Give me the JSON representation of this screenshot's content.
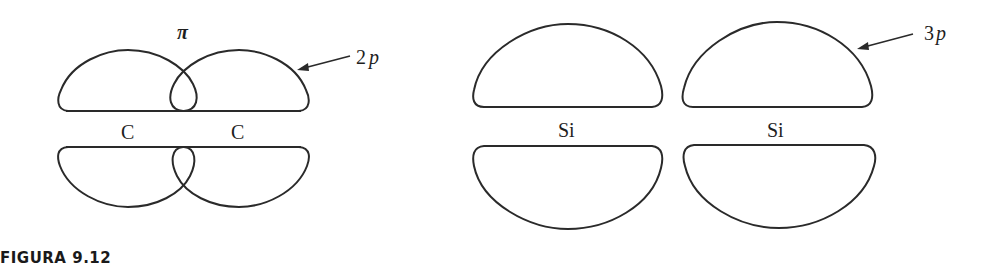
{
  "figure": {
    "caption": "FIGURA 9.12",
    "left_diagram": {
      "bond_label": "π",
      "orbital_label_number": "2",
      "orbital_label_letter": "p",
      "atoms": [
        "C",
        "C"
      ]
    },
    "right_diagram": {
      "orbital_label_number": "3",
      "orbital_label_letter": "p",
      "atoms": [
        "Si",
        "Si"
      ]
    },
    "colors": {
      "stroke": "#2a2a2a",
      "text": "#1e1e1e",
      "background": "#ffffff"
    }
  }
}
